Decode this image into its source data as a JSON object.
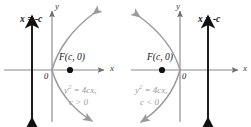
{
  "figure": {
    "type": "math-diagram",
    "colors": {
      "axis": "#8a8a8a",
      "curve": "#9a9a9a",
      "directrix": "#111111",
      "focus_dot": "#111111",
      "label_gray": "#9a9a9a",
      "label_black": "#111111",
      "background": "#ffffff"
    }
  },
  "panels": [
    {
      "id": "left",
      "directrix_label": "x = -c",
      "focus_label": "F(c, 0)",
      "origin_label": "0",
      "x_axis_label": "x",
      "y_axis_label": "y",
      "equation_line1_base": "y",
      "equation_line1_exp": "2",
      "equation_line1_rest": " = 4cx,",
      "equation_line2": "c > 0",
      "opens": "right",
      "c_sign": "positive"
    },
    {
      "id": "right",
      "directrix_label": "x = -c",
      "focus_label": "F(c, 0)",
      "origin_label": "0",
      "x_axis_label": "x",
      "y_axis_label": "y",
      "equation_line1_base": "y",
      "equation_line1_exp": "2",
      "equation_line1_rest": " = 4cx,",
      "equation_line2": "c < 0",
      "opens": "left",
      "c_sign": "negative"
    }
  ]
}
